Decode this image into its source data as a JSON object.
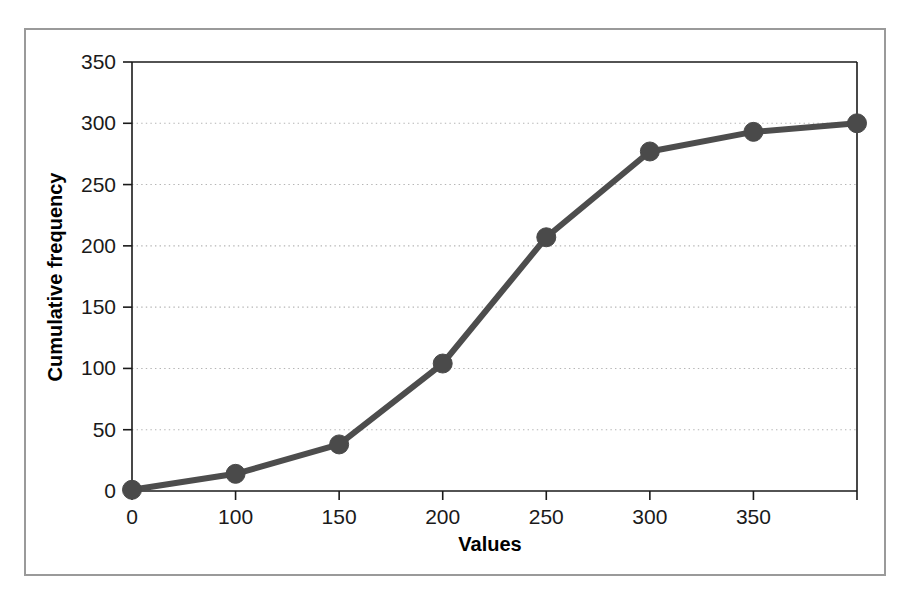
{
  "figure": {
    "background_color": "#ffffff",
    "frame_color": "#9a9a9a"
  },
  "chart_data": {
    "type": "line",
    "title": "",
    "subtitle": "",
    "xlabel": "Values",
    "ylabel": "Cumulative frequency",
    "x_tick_labels": [
      "0",
      "100",
      "150",
      "200",
      "250",
      "300",
      "350",
      ""
    ],
    "y_tick_labels": [
      "0",
      "50",
      "100",
      "150",
      "200",
      "250",
      "300",
      "350"
    ],
    "y_ticks": [
      0,
      50,
      100,
      150,
      200,
      250,
      300,
      350
    ],
    "ylim": [
      0,
      350
    ],
    "grid": "horizontal-dotted",
    "legend": "none",
    "categories": [
      "0",
      "100",
      "150",
      "200",
      "250",
      "300",
      "350",
      ""
    ],
    "values": [
      1,
      14,
      38,
      104,
      207,
      277,
      293,
      300
    ],
    "series": [
      {
        "name": "Cumulative frequency",
        "color": "#4a4a4a",
        "marker": "circle",
        "values": [
          1,
          14,
          38,
          104,
          207,
          277,
          293,
          300
        ]
      }
    ],
    "line_color": "#4a4a4a",
    "marker_color": "#4a4a4a",
    "gridline_color": "#b5b5b5",
    "axis_color": "#1a1a1a"
  }
}
